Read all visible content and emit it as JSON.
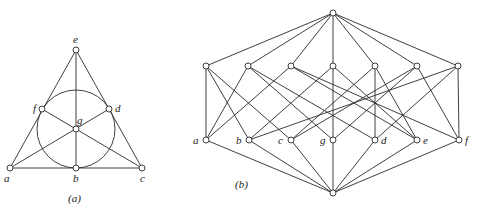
{
  "figure_a": {
    "caption": "(a)",
    "description": "Fano plane",
    "points": [
      {
        "id": "e",
        "label": "e",
        "x": 76,
        "y": 50,
        "lx": 73,
        "ly": 43
      },
      {
        "id": "f",
        "label": "f",
        "x": 42,
        "y": 109,
        "lx": 33,
        "ly": 112
      },
      {
        "id": "d",
        "label": "d",
        "x": 109,
        "y": 109,
        "lx": 115,
        "ly": 112
      },
      {
        "id": "g",
        "label": "g",
        "x": 76,
        "y": 129,
        "lx": 77,
        "ly": 124
      },
      {
        "id": "a",
        "label": "a",
        "x": 10,
        "y": 168,
        "lx": 4,
        "ly": 182
      },
      {
        "id": "b",
        "label": "b",
        "x": 76,
        "y": 168,
        "lx": 73,
        "ly": 182
      },
      {
        "id": "c",
        "label": "c",
        "x": 142,
        "y": 168,
        "lx": 140,
        "ly": 182
      }
    ],
    "lines": [
      [
        "a",
        "f",
        "e"
      ],
      [
        "e",
        "d",
        "c"
      ],
      [
        "a",
        "b",
        "c"
      ],
      [
        "a",
        "g",
        "d"
      ],
      [
        "e",
        "g",
        "b"
      ],
      [
        "c",
        "g",
        "f"
      ]
    ],
    "circle": {
      "through": [
        "f",
        "d",
        "b"
      ],
      "cx": 76,
      "cy": 129,
      "r": 39
    },
    "caption_pos": {
      "x": 68,
      "y": 202
    }
  },
  "figure_b": {
    "caption": "(b)",
    "description": "Lattice of subspaces of the Fano plane",
    "top": {
      "x": 333,
      "y": 13
    },
    "bottom": {
      "x": 333,
      "y": 193
    },
    "upper_row": [
      {
        "x": 206,
        "y": 66,
        "points": [
          "a",
          "b",
          "c"
        ]
      },
      {
        "x": 248,
        "y": 66,
        "points": [
          "a",
          "g",
          "d"
        ]
      },
      {
        "x": 291,
        "y": 66,
        "points": [
          "a",
          "f",
          "e"
        ]
      },
      {
        "x": 333,
        "y": 66,
        "points": [
          "b",
          "g",
          "e"
        ]
      },
      {
        "x": 375,
        "y": 66,
        "points": [
          "c",
          "d",
          "e"
        ]
      },
      {
        "x": 417,
        "y": 66,
        "points": [
          "c",
          "g",
          "f"
        ]
      },
      {
        "x": 458,
        "y": 66,
        "points": [
          "b",
          "d",
          "f"
        ]
      }
    ],
    "lower_row": [
      {
        "id": "a",
        "label": "a",
        "x": 206,
        "y": 140
      },
      {
        "id": "b",
        "label": "b",
        "x": 249,
        "y": 140
      },
      {
        "id": "c",
        "label": "c",
        "x": 291,
        "y": 140
      },
      {
        "id": "g",
        "label": "g",
        "x": 333,
        "y": 140
      },
      {
        "id": "d",
        "label": "d",
        "x": 375,
        "y": 140
      },
      {
        "id": "e",
        "label": "e",
        "x": 417,
        "y": 140
      },
      {
        "id": "f",
        "label": "f",
        "x": 459,
        "y": 140
      }
    ],
    "caption_pos": {
      "x": 235,
      "y": 188
    }
  }
}
